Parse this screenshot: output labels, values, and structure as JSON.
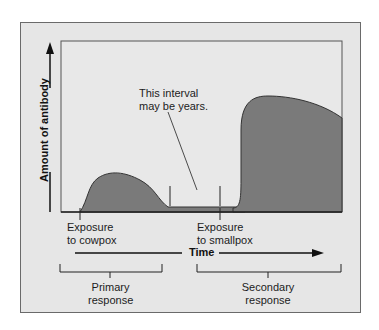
{
  "diagram": {
    "y_axis_label": "Amount of antibody",
    "x_axis_label": "Time",
    "annotation": {
      "line1": "This interval",
      "line2": "may be years."
    },
    "events": [
      {
        "line1": "Exposure",
        "line2": "to cowpox"
      },
      {
        "line1": "Exposure",
        "line2": "to smallpox"
      }
    ],
    "brackets": [
      {
        "line1": "Primary",
        "line2": "response"
      },
      {
        "line1": "Secondary",
        "line2": "response"
      }
    ],
    "colors": {
      "background": "#e6e6e6",
      "curve_fill": "#7a7a7a",
      "lines": "#222222"
    }
  }
}
